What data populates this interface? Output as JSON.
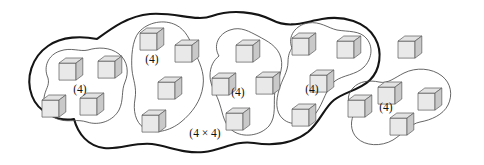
{
  "figure": {
    "canvas": {
      "width": 484,
      "height": 165,
      "background": "#ffffff"
    },
    "colors": {
      "outer_boundary_stroke": "#151515",
      "group_boundary_stroke": "#4a4a4a",
      "cube_top_fill": "#e2e2e2",
      "cube_left_fill": "#e9e9e9",
      "cube_right_fill": "#c9c9c9",
      "cube_edge_stroke": "#5a5a5a",
      "label_color": "#111111"
    },
    "outer_region": {
      "label": "(4 × 4)",
      "label_x": 205,
      "label_y": 137,
      "contains_group_count": 4,
      "outline": "M 74,119 C 58,122 38,112 32,96 C 25,78 32,57 48,46 C 62,36 82,36 97,39 C 112,28 128,16 150,14 C 176,12 196,22 212,16 C 232,9 256,12 272,20 C 290,29 304,22 322,19 C 344,15 366,22 375,38 C 383,52 380,70 370,80 C 360,90 344,92 334,100 C 324,108 320,122 308,132 C 294,143 274,146 254,143 C 236,140 222,150 204,152 C 184,154 168,146 152,144 C 134,142 120,150 104,148 C 88,146 78,134 74,119 Z"
    },
    "groups": [
      {
        "id": "group-1",
        "label": "(4)",
        "label_x": 80,
        "label_y": 93,
        "cube_count": 4,
        "outline": "M 48,78 C 43,67 48,55 60,51 C 71,47 80,52 88,50 C 98,47 110,47 119,54 C 128,61 129,73 125,82 C 121,91 124,100 119,110 C 113,121 99,126 87,122 C 77,119 70,122 61,120 C 50,118 43,108 44,98 C 45,89 50,86 48,78 Z",
        "cubes": [
          {
            "x": 59,
            "y": 58,
            "size": 17
          },
          {
            "x": 98,
            "y": 56,
            "size": 17
          },
          {
            "x": 42,
            "y": 95,
            "size": 17
          },
          {
            "x": 80,
            "y": 93,
            "size": 17
          }
        ]
      },
      {
        "id": "group-2",
        "label": "(4)",
        "label_x": 152,
        "label_y": 63,
        "cube_count": 4,
        "outline": "M 139,32 C 148,22 164,19 176,25 C 186,30 190,40 194,50 C 199,62 205,72 203,86 C 201,101 192,113 181,122 C 170,131 154,135 144,128 C 135,122 133,110 135,99 C 137,87 133,80 132,70 C 131,58 132,40 139,32 Z",
        "cubes": [
          {
            "x": 140,
            "y": 28,
            "size": 17
          },
          {
            "x": 175,
            "y": 40,
            "size": 17
          },
          {
            "x": 158,
            "y": 77,
            "size": 17
          },
          {
            "x": 142,
            "y": 110,
            "size": 17
          }
        ]
      },
      {
        "id": "group-3",
        "label": "(4)",
        "label_x": 238,
        "label_y": 96,
        "cube_count": 4,
        "outline": "M 219,56 C 213,46 218,34 230,30 C 241,26 250,32 258,36 C 267,41 278,46 281,58 C 284,70 277,80 275,91 C 273,103 277,116 269,126 C 260,136 243,138 233,131 C 224,125 223,114 220,105 C 217,94 210,86 210,76 C 210,66 214,60 219,56 Z",
        "cubes": [
          {
            "x": 236,
            "y": 40,
            "size": 17
          },
          {
            "x": 212,
            "y": 73,
            "size": 17
          },
          {
            "x": 256,
            "y": 72,
            "size": 17
          },
          {
            "x": 226,
            "y": 108,
            "size": 17
          }
        ]
      },
      {
        "id": "group-4",
        "label": "(4)",
        "label_x": 312,
        "label_y": 93,
        "cube_count": 4,
        "outline": "M 292,48 C 287,36 296,25 308,23 C 320,21 328,28 337,30 C 348,32 360,30 367,39 C 374,48 371,60 364,67 C 356,75 343,75 335,81 C 326,88 324,102 316,113 C 308,124 292,127 283,119 C 275,112 276,100 279,90 C 282,79 288,72 288,62 C 288,55 290,51 292,48 Z",
        "cubes": [
          {
            "x": 292,
            "y": 33,
            "size": 17
          },
          {
            "x": 337,
            "y": 36,
            "size": 17
          },
          {
            "x": 310,
            "y": 70,
            "size": 17
          },
          {
            "x": 292,
            "y": 104,
            "size": 17
          }
        ]
      },
      {
        "id": "group-5",
        "label": "(4)",
        "label_x": 386,
        "label_y": 111,
        "cube_count": 4,
        "outline": "M 355,112 C 347,106 346,95 353,88 C 359,81 370,80 379,82 C 388,84 394,78 404,73 C 416,67 432,68 442,76 C 451,83 453,95 448,105 C 443,115 431,120 420,122 C 410,124 404,133 393,140 C 381,147 365,146 357,138 C 350,131 350,120 355,112 Z",
        "cubes": [
          {
            "x": 348,
            "y": 95,
            "size": 17
          },
          {
            "x": 378,
            "y": 82,
            "size": 17
          },
          {
            "x": 418,
            "y": 88,
            "size": 17
          },
          {
            "x": 390,
            "y": 113,
            "size": 17
          }
        ]
      }
    ],
    "ungrouped_cubes": [
      {
        "id": "lone-cube",
        "x": 398,
        "y": 36,
        "size": 17
      }
    ]
  }
}
